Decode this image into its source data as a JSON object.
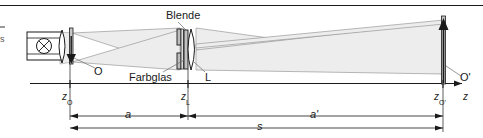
{
  "figure": {
    "type": "optical-ray-diagram",
    "title_visible": false,
    "background": "#ffffff",
    "line_color": "#1a1a1a",
    "beam_fill": "#ededed",
    "beam_edge": "#8a8a8a",
    "glass_fill": "#cfcfcf"
  },
  "labels": {
    "blende": "Blende",
    "farbglas": "Farbglas",
    "lens": "L",
    "object": "O",
    "image": "O'",
    "z_axis": "z"
  },
  "axis_ticks": [
    {
      "id": "z-object",
      "base": "z",
      "sub": "O",
      "x": 70
    },
    {
      "id": "z-lens",
      "base": "z",
      "sub": "L",
      "x": 188
    },
    {
      "id": "z-image",
      "base": "z",
      "sub": "O'",
      "x": 443
    }
  ],
  "dimensions": [
    {
      "id": "dim-a",
      "label": "a",
      "from": "z_O",
      "to": "z_L",
      "x1": 70,
      "x2": 188,
      "y": 116
    },
    {
      "id": "dim-a-prime",
      "label": "a'",
      "from": "z_L",
      "to": "z_O'",
      "x1": 188,
      "x2": 443,
      "y": 116
    },
    {
      "id": "dim-s",
      "label": "s",
      "from": "z_O",
      "to": "z_O'",
      "x1": 70,
      "x2": 443,
      "y": 128
    }
  ],
  "elements": [
    {
      "id": "lamp-housing",
      "name": "lamp housing"
    },
    {
      "id": "lamp-bulb",
      "name": "lamp symbol"
    },
    {
      "id": "condenser-lens",
      "name": "condenser lens"
    },
    {
      "id": "object-arrow",
      "name": "object arrow O"
    },
    {
      "id": "aperture",
      "name": "Blende"
    },
    {
      "id": "color-filter",
      "name": "Farbglas"
    },
    {
      "id": "imaging-lens",
      "name": "L"
    },
    {
      "id": "image-arrow",
      "name": "image arrow O'"
    }
  ],
  "edge_text": {
    "left_fragment_1": "-",
    "left_fragment_2": "s"
  }
}
